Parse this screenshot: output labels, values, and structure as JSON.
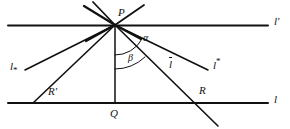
{
  "figure": {
    "type": "geometry-diagram",
    "width": 290,
    "height": 129,
    "background_color": "#ffffff",
    "ink_color": "#111111"
  },
  "points": [
    {
      "id": "P",
      "label": "P",
      "x": 115,
      "y": 25,
      "label_x": 118,
      "label_y": 9
    },
    {
      "id": "Q",
      "label": "Q",
      "x": 115,
      "y": 103,
      "label_x": 111,
      "label_y": 110
    },
    {
      "id": "R",
      "label": "R",
      "x": 196,
      "y": 103,
      "label_x": 199,
      "label_y": 87
    },
    {
      "id": "Rprime",
      "label": "R",
      "prime": "'",
      "x": 33,
      "y": 103,
      "label_x": 48,
      "label_y": 88
    }
  ],
  "lines": [
    {
      "id": "l-prime",
      "label": "l",
      "prime": "'",
      "kind": "horizontal",
      "y": 25,
      "x1": 8,
      "x2": 268,
      "label_x": 274,
      "label_y": 17
    },
    {
      "id": "l",
      "label": "l",
      "kind": "horizontal",
      "y": 103,
      "x1": 8,
      "x2": 268,
      "label_x": 274,
      "label_y": 95
    },
    {
      "id": "PQ",
      "label": "",
      "kind": "perpendicular",
      "x1": 115,
      "y1": 25,
      "x2": 115,
      "y2": 103
    }
  ],
  "rays": [
    {
      "id": "ray-l-sub-star",
      "label": "l",
      "sub": "*",
      "from": "P",
      "to_x": 24,
      "to_y": 70,
      "label_x": 11,
      "label_y": 62
    },
    {
      "id": "ray-R-prime",
      "label": "",
      "from": "P",
      "to_x": 33,
      "to_y": 103,
      "label_x": 0,
      "label_y": 0
    },
    {
      "id": "ray-l-bar",
      "label": "l",
      "overbar": true,
      "from": "P",
      "to_x": 218,
      "to_y": 125,
      "label_x": 170,
      "label_y": 57
    },
    {
      "id": "ray-l-super-star",
      "label": "l",
      "sup": "*",
      "from": "P",
      "to_x": 207,
      "to_y": 70,
      "label_x": 214,
      "label_y": 58
    }
  ],
  "pencil_strokes": [
    {
      "id": "stroke-up-left-1",
      "x1": 115,
      "y1": 25,
      "x2": 84,
      "y2": 6
    },
    {
      "id": "stroke-up-left-2",
      "x1": 115,
      "y1": 25,
      "x2": 92,
      "y2": 2
    },
    {
      "id": "stroke-up-right-1",
      "x1": 115,
      "y1": 25,
      "x2": 143,
      "y2": 5
    },
    {
      "id": "stroke-down-left-1",
      "x1": 115,
      "y1": 25,
      "x2": 88,
      "y2": 40
    },
    {
      "id": "stroke-down-right-1",
      "x1": 115,
      "y1": 25,
      "x2": 140,
      "y2": 38
    }
  ],
  "angles": [
    {
      "id": "alpha",
      "label": "α",
      "label_x": 143,
      "label_y": 37,
      "vertex": "P",
      "arc_radius": 30,
      "between": [
        "PQ",
        "ray-l-super-star"
      ]
    },
    {
      "id": "beta",
      "label": "β",
      "label_x": 129,
      "label_y": 56,
      "vertex": "P",
      "arc_radius": 44,
      "between": [
        "PQ",
        "ray-l-bar"
      ]
    }
  ]
}
